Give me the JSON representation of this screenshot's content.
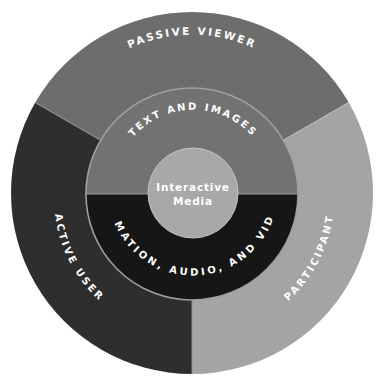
{
  "diagram": {
    "type": "concentric-ring-diagram",
    "center": {
      "label_line1": "Interactive",
      "label_line2": "Media",
      "color": "#a8a8a8"
    },
    "inner_ring": [
      {
        "label": "TEXT AND IMAGES",
        "color": "#727272",
        "position": "top-half"
      },
      {
        "label": "ANIMATION, AUDIO, AND VIDEO",
        "color": "#161616",
        "position": "bottom-half"
      }
    ],
    "outer_ring": [
      {
        "label": "PASSIVE VIEWER",
        "color": "#6d6d6d",
        "position": "top"
      },
      {
        "label": "ACTIVE USER",
        "color": "#2e2e2e",
        "position": "lower-left"
      },
      {
        "label": "PARTICIPANT",
        "color": "#a4a4a4",
        "position": "lower-right"
      }
    ],
    "divider_color": "#9a9a9a"
  }
}
